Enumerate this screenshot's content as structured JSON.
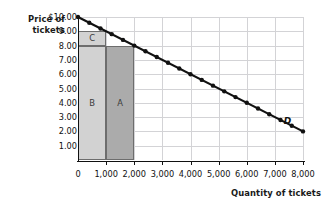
{
  "chart_data": {
    "type": "line",
    "title": "",
    "xlabel": "Quantity of tickets",
    "ylabel": "Price of tickets",
    "ylabel_lines": [
      "Price of",
      "tickets"
    ],
    "xlim": [
      0,
      8000
    ],
    "ylim": [
      0,
      10
    ],
    "grid": true,
    "legend": null,
    "x_ticks": [
      0,
      1000,
      2000,
      3000,
      4000,
      5000,
      6000,
      7000,
      8000
    ],
    "x_tick_labels": [
      "0",
      "1,000",
      "2,000",
      "3,000",
      "4,000",
      "5,000",
      "6,000",
      "7,000",
      "8,000"
    ],
    "y_ticks": [
      1,
      2,
      3,
      4,
      5,
      6,
      7,
      8,
      9,
      10
    ],
    "y_tick_labels": [
      "1.00",
      "2.00",
      "3.00",
      "4.00",
      "5.00",
      "6.00",
      "7.00",
      "8.00",
      "9.00",
      "$10.00"
    ],
    "series": [
      {
        "name": "D",
        "label": "D",
        "type": "line",
        "color": "#111111",
        "marker": "circle",
        "x": [
          0,
          400,
          800,
          1200,
          1600,
          2000,
          2400,
          2800,
          3200,
          3600,
          4000,
          4400,
          4800,
          5200,
          5600,
          6000,
          6400,
          6800,
          7200,
          7600,
          8000
        ],
        "y": [
          10.0,
          9.6,
          9.2,
          8.8,
          8.4,
          8.0,
          7.6,
          7.2,
          6.8,
          6.4,
          6.0,
          5.6,
          5.2,
          4.8,
          4.4,
          4.0,
          3.6,
          3.2,
          2.8,
          2.4,
          2.0
        ],
        "endpoints": [
          [
            0,
            10.0
          ],
          [
            8000,
            2.0
          ]
        ],
        "label_at": [
          7450,
          2.75
        ]
      }
    ],
    "regions": [
      {
        "id": "C",
        "label": "C",
        "x0": 0,
        "x1": 1000,
        "y0": 8,
        "y1": 9,
        "fill": "#d2d2d2",
        "stroke": "#6d6d6d",
        "label_at": [
          500,
          8.5
        ]
      },
      {
        "id": "B",
        "label": "B",
        "x0": 0,
        "x1": 1000,
        "y0": 0,
        "y1": 8,
        "fill": "#d2d2d2",
        "stroke": "#6d6d6d",
        "label_at": [
          500,
          4.0
        ]
      },
      {
        "id": "A",
        "label": "A",
        "x0": 1000,
        "x1": 2000,
        "y0": 0,
        "y1": 8,
        "fill": "#ababab",
        "stroke": "#6d6d6d",
        "label_at": [
          1500,
          4.0
        ]
      }
    ],
    "colors": {
      "grid": "#d3d3d6",
      "axis": "#111111",
      "curve": "#111111",
      "region_light": "#d2d2d2",
      "region_dark": "#ababab",
      "background": "#ffffff"
    }
  }
}
